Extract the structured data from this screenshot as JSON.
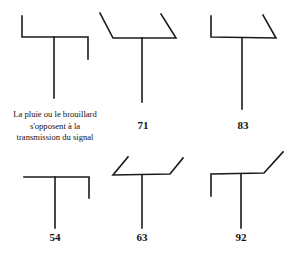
{
  "caption": {
    "line1": "La pluie ou le brouillard",
    "line2": "s'opposent  à la",
    "line3": "transmission du signal"
  },
  "symbols": [
    {
      "id": "s1",
      "label": ""
    },
    {
      "id": "s2",
      "label": "71"
    },
    {
      "id": "s3",
      "label": "83"
    },
    {
      "id": "s4",
      "label": "54"
    },
    {
      "id": "s5",
      "label": "63"
    },
    {
      "id": "s6",
      "label": "92"
    }
  ],
  "stroke_color": "#1a1a1a"
}
